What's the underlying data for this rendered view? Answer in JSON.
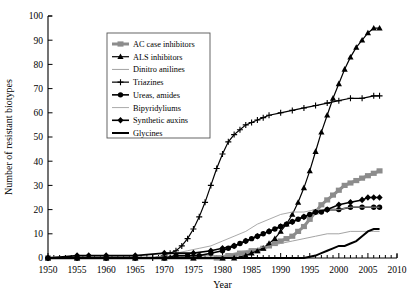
{
  "chart_data": {
    "type": "line",
    "title": "",
    "xlabel": "Year",
    "ylabel": "Number of resistant biotypes",
    "xlim": [
      1950,
      2010
    ],
    "ylim": [
      0,
      100
    ],
    "xticks": [
      1950,
      1955,
      1960,
      1965,
      1970,
      1975,
      1980,
      1985,
      1990,
      1995,
      2000,
      2005,
      2010
    ],
    "yticks": [
      0,
      10,
      20,
      30,
      40,
      50,
      60,
      70,
      80,
      90,
      100
    ],
    "xtick_labels": [
      "1950",
      "1955",
      "1960",
      "1965",
      "1970",
      "1975",
      "1980",
      "1985",
      "1990",
      "1995",
      "2000",
      "2005",
      "2010"
    ],
    "ytick_labels": [
      "0",
      "10",
      "20",
      "30",
      "40",
      "50",
      "60",
      "70",
      "80",
      "90",
      "100"
    ],
    "grid": false,
    "legend_position": "upper-left-inset",
    "series": [
      {
        "name": "AC case inhibitors",
        "marker": "square",
        "color": "#8c8c8c",
        "line_width": 3.0,
        "x": [
          1950,
          1955,
          1960,
          1965,
          1970,
          1975,
          1979,
          1980,
          1981,
          1982,
          1983,
          1984,
          1985,
          1986,
          1987,
          1988,
          1989,
          1990,
          1991,
          1992,
          1993,
          1994,
          1995,
          1996,
          1997,
          1998,
          1999,
          2000,
          2001,
          2002,
          2003,
          2004,
          2005,
          2006,
          2007
        ],
        "values": [
          0,
          0,
          0,
          0,
          0,
          0,
          0,
          0,
          1,
          1,
          2,
          2,
          3,
          3,
          4,
          5,
          6,
          7,
          8,
          9,
          11,
          13,
          16,
          19,
          22,
          24,
          26,
          28,
          30,
          31,
          32,
          33,
          34,
          35,
          36
        ]
      },
      {
        "name": "ALS inhibitors",
        "marker": "triangle",
        "color": "#000000",
        "line_width": 1.2,
        "x": [
          1950,
          1955,
          1960,
          1965,
          1970,
          1975,
          1980,
          1982,
          1984,
          1985,
          1986,
          1987,
          1988,
          1989,
          1990,
          1991,
          1992,
          1993,
          1994,
          1995,
          1996,
          1997,
          1998,
          1999,
          2000,
          2001,
          2002,
          2003,
          2004,
          2005,
          2006,
          2007
        ],
        "values": [
          0,
          0,
          0,
          0,
          0,
          0,
          0,
          0,
          1,
          2,
          3,
          4,
          6,
          8,
          11,
          14,
          18,
          23,
          29,
          36,
          44,
          52,
          59,
          66,
          72,
          78,
          83,
          87,
          90,
          93,
          95,
          95
        ]
      },
      {
        "name": "Dinitro anilines",
        "marker": "none",
        "color": "#999999",
        "line_width": 0.9,
        "x": [
          1950,
          1960,
          1970,
          1975,
          1980,
          1982,
          1984,
          1986,
          1988,
          1990,
          1992,
          1994,
          1996,
          1998,
          2000,
          2002,
          2004,
          2006,
          2007
        ],
        "values": [
          0,
          0,
          0,
          1,
          1,
          2,
          3,
          4,
          5,
          6,
          7,
          8,
          9,
          10,
          10,
          11,
          11,
          11,
          11
        ]
      },
      {
        "name": "Triazines",
        "marker": "cross",
        "color": "#000000",
        "line_width": 1.2,
        "x": [
          1950,
          1955,
          1960,
          1965,
          1968,
          1970,
          1971,
          1972,
          1973,
          1974,
          1975,
          1976,
          1977,
          1978,
          1979,
          1980,
          1981,
          1982,
          1983,
          1984,
          1985,
          1986,
          1987,
          1988,
          1990,
          1992,
          1994,
          1996,
          1998,
          2000,
          2002,
          2004,
          2006,
          2007
        ],
        "values": [
          0,
          0,
          0,
          0,
          0,
          1,
          2,
          3,
          5,
          8,
          12,
          17,
          23,
          30,
          37,
          43,
          48,
          51,
          53,
          55,
          56,
          57,
          58,
          59,
          60,
          61,
          62,
          63,
          64,
          65,
          66,
          66,
          67,
          67
        ]
      },
      {
        "name": "Ureas, amides",
        "marker": "circle",
        "color": "#000000",
        "line_width": 1.6,
        "x": [
          1950,
          1955,
          1960,
          1965,
          1970,
          1972,
          1974,
          1976,
          1978,
          1980,
          1981,
          1982,
          1983,
          1984,
          1985,
          1986,
          1987,
          1988,
          1989,
          1990,
          1991,
          1992,
          1993,
          1994,
          1995,
          1996,
          1997,
          1998,
          2000,
          2002,
          2004,
          2006,
          2007
        ],
        "values": [
          0,
          0,
          0,
          0,
          0,
          1,
          1,
          1,
          2,
          3,
          4,
          5,
          6,
          7,
          8,
          9,
          10,
          11,
          12,
          13,
          14,
          15,
          16,
          17,
          18,
          19,
          19,
          20,
          20,
          21,
          21,
          21,
          21
        ]
      },
      {
        "name": "Bipyridyliums",
        "marker": "none",
        "color": "#a0a0a0",
        "line_width": 0.9,
        "x": [
          1950,
          1960,
          1968,
          1970,
          1972,
          1974,
          1976,
          1978,
          1980,
          1982,
          1984,
          1986,
          1988,
          1990,
          1992,
          1994,
          1996,
          1998,
          2000,
          2002,
          2004,
          2006,
          2007
        ],
        "values": [
          0,
          0,
          0,
          1,
          2,
          3,
          4,
          5,
          7,
          9,
          11,
          14,
          16,
          18,
          19,
          19,
          20,
          20,
          20,
          21,
          21,
          21,
          21
        ]
      },
      {
        "name": "Synthetic auxins",
        "marker": "diamond",
        "color": "#000000",
        "line_width": 1.6,
        "x": [
          1950,
          1955,
          1957,
          1960,
          1965,
          1970,
          1975,
          1978,
          1980,
          1982,
          1984,
          1986,
          1988,
          1990,
          1992,
          1994,
          1996,
          1998,
          2000,
          2002,
          2004,
          2005,
          2006,
          2007
        ],
        "values": [
          0,
          1,
          1,
          1,
          1,
          2,
          2,
          3,
          4,
          5,
          7,
          9,
          11,
          13,
          15,
          17,
          19,
          20,
          22,
          23,
          24,
          25,
          25,
          25
        ]
      },
      {
        "name": "Glycines",
        "marker": "none",
        "color": "#000000",
        "line_width": 2.0,
        "x": [
          1950,
          1960,
          1970,
          1980,
          1990,
          1994,
          1996,
          1997,
          1998,
          1999,
          2000,
          2001,
          2002,
          2003,
          2004,
          2005,
          2006,
          2007
        ],
        "values": [
          0,
          0,
          0,
          0,
          0,
          0,
          1,
          2,
          3,
          4,
          5,
          5,
          6,
          7,
          9,
          11,
          12,
          12
        ]
      }
    ]
  },
  "legend": {
    "items": [
      {
        "label": "AC case inhibitors"
      },
      {
        "label": "ALS inhibitors"
      },
      {
        "label": "Dinitro anilines"
      },
      {
        "label": "Triazines"
      },
      {
        "label": "Ureas, amides"
      },
      {
        "label": "Bipyridyliums"
      },
      {
        "label": "Synthetic auxins"
      },
      {
        "label": "Glycines"
      }
    ]
  }
}
